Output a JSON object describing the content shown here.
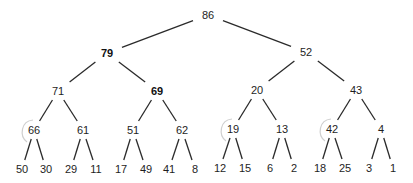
{
  "diagram": {
    "type": "binary-tree",
    "nodes": [
      {
        "id": 0,
        "value": "86",
        "x": 208,
        "y": 15,
        "bold": false
      },
      {
        "id": 1,
        "value": "79",
        "x": 107,
        "y": 53,
        "bold": true
      },
      {
        "id": 2,
        "value": "52",
        "x": 306,
        "y": 52,
        "bold": false
      },
      {
        "id": 3,
        "value": "71",
        "x": 58,
        "y": 91,
        "bold": false
      },
      {
        "id": 4,
        "value": "69",
        "x": 157,
        "y": 91,
        "bold": true
      },
      {
        "id": 5,
        "value": "20",
        "x": 257,
        "y": 90,
        "bold": false
      },
      {
        "id": 6,
        "value": "43",
        "x": 356,
        "y": 90,
        "bold": false
      },
      {
        "id": 7,
        "value": "66",
        "x": 34,
        "y": 130,
        "bold": false
      },
      {
        "id": 8,
        "value": "61",
        "x": 83,
        "y": 130,
        "bold": false
      },
      {
        "id": 9,
        "value": "51",
        "x": 133,
        "y": 130,
        "bold": false
      },
      {
        "id": 10,
        "value": "62",
        "x": 182,
        "y": 130,
        "bold": false
      },
      {
        "id": 11,
        "value": "19",
        "x": 233,
        "y": 129,
        "bold": false
      },
      {
        "id": 12,
        "value": "13",
        "x": 282,
        "y": 129,
        "bold": false
      },
      {
        "id": 13,
        "value": "42",
        "x": 332,
        "y": 129,
        "bold": false
      },
      {
        "id": 14,
        "value": "4",
        "x": 381,
        "y": 129,
        "bold": false
      },
      {
        "id": 15,
        "value": "50",
        "x": 22,
        "y": 169,
        "bold": false
      },
      {
        "id": 16,
        "value": "30",
        "x": 46,
        "y": 169,
        "bold": false
      },
      {
        "id": 17,
        "value": "29",
        "x": 71,
        "y": 169,
        "bold": false
      },
      {
        "id": 18,
        "value": "11",
        "x": 96,
        "y": 169,
        "bold": false
      },
      {
        "id": 19,
        "value": "17",
        "x": 121,
        "y": 169,
        "bold": false
      },
      {
        "id": 20,
        "value": "49",
        "x": 146,
        "y": 169,
        "bold": false
      },
      {
        "id": 21,
        "value": "41",
        "x": 169,
        "y": 169,
        "bold": false
      },
      {
        "id": 22,
        "value": "8",
        "x": 195,
        "y": 169,
        "bold": false
      },
      {
        "id": 23,
        "value": "12",
        "x": 220,
        "y": 168,
        "bold": false
      },
      {
        "id": 24,
        "value": "15",
        "x": 245,
        "y": 168,
        "bold": false
      },
      {
        "id": 25,
        "value": "6",
        "x": 270,
        "y": 168,
        "bold": false
      },
      {
        "id": 26,
        "value": "2",
        "x": 294,
        "y": 168,
        "bold": false
      },
      {
        "id": 27,
        "value": "18",
        "x": 320,
        "y": 168,
        "bold": false
      },
      {
        "id": 28,
        "value": "25",
        "x": 345,
        "y": 168,
        "bold": false
      },
      {
        "id": 29,
        "value": "3",
        "x": 369,
        "y": 168,
        "bold": false
      },
      {
        "id": 30,
        "value": "1",
        "x": 393,
        "y": 168,
        "bold": false
      }
    ],
    "edges": [
      [
        0,
        1
      ],
      [
        0,
        2
      ],
      [
        1,
        3
      ],
      [
        1,
        4
      ],
      [
        2,
        5
      ],
      [
        2,
        6
      ],
      [
        3,
        7
      ],
      [
        3,
        8
      ],
      [
        4,
        9
      ],
      [
        4,
        10
      ],
      [
        5,
        11
      ],
      [
        5,
        12
      ],
      [
        6,
        13
      ],
      [
        6,
        14
      ],
      [
        7,
        15
      ],
      [
        7,
        16
      ],
      [
        8,
        17
      ],
      [
        8,
        18
      ],
      [
        9,
        19
      ],
      [
        9,
        20
      ],
      [
        10,
        21
      ],
      [
        10,
        22
      ],
      [
        11,
        23
      ],
      [
        11,
        24
      ],
      [
        12,
        25
      ],
      [
        12,
        26
      ],
      [
        13,
        27
      ],
      [
        13,
        28
      ],
      [
        14,
        29
      ],
      [
        14,
        30
      ]
    ],
    "annotations": [
      {
        "type": "faint-arc",
        "near_node": 7,
        "color": "#cfcfcf"
      },
      {
        "type": "faint-arc",
        "near_node": 11,
        "color": "#cfcfcf"
      },
      {
        "type": "faint-arc",
        "near_node": 13,
        "color": "#cfcfcf"
      }
    ],
    "colors": {
      "edge": "#2a2a2a",
      "text": "#1e1e1e",
      "background": "#ffffff",
      "annotation": "#cfcfcf"
    }
  }
}
